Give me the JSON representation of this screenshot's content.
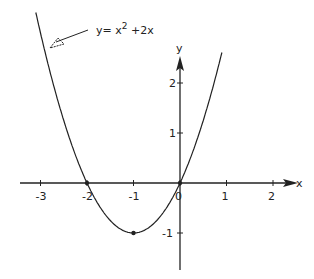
{
  "chart_data": {
    "type": "line",
    "title": "",
    "annotation": {
      "label": "y = x^2 + 2x",
      "base": "y= x",
      "exp": "2",
      "tail": " +2x"
    },
    "xlabel": "x",
    "ylabel": "y",
    "xlim": [
      -3.3,
      2.4
    ],
    "ylim": [
      -1.7,
      2.7
    ],
    "x_ticks": [
      -3,
      -2,
      -1,
      0,
      1,
      2
    ],
    "x_tick_labels": [
      "-3",
      "-2",
      "-1",
      "0",
      "1",
      "2"
    ],
    "y_ticks": [
      -1,
      1,
      2
    ],
    "y_tick_labels": [
      "-1",
      "1",
      "2"
    ],
    "grid": false,
    "series": [
      {
        "name": "y = x^2 + 2x",
        "x": [
          -3.1,
          -3,
          -2.5,
          -2,
          -1.5,
          -1,
          -0.5,
          0,
          0.5,
          0.9
        ],
        "values": [
          3.41,
          3,
          1.25,
          0,
          -0.75,
          -1,
          -0.75,
          0,
          1.25,
          2.61
        ]
      }
    ],
    "marked_points": [
      {
        "x": -2,
        "y": 0
      },
      {
        "x": -1,
        "y": -1
      },
      {
        "x": 0,
        "y": 0
      }
    ]
  }
}
